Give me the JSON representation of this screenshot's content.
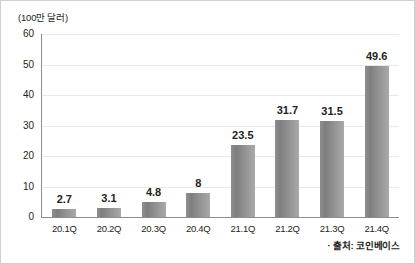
{
  "chart_data": {
    "type": "bar",
    "title": "",
    "unit_caption": "(100만 달러)",
    "xlabel": "",
    "ylabel": "",
    "ylim": [
      0,
      60
    ],
    "yticks": [
      0,
      10,
      20,
      30,
      40,
      50,
      60
    ],
    "ytick_labels": [
      "0",
      "10",
      "20",
      "30",
      "40",
      "50",
      "60"
    ],
    "grid": true,
    "legend": "none",
    "categories": [
      "20.1Q",
      "20.2Q",
      "20.3Q",
      "20.4Q",
      "21.1Q",
      "21.2Q",
      "21.3Q",
      "21.4Q"
    ],
    "values": [
      2.7,
      3.1,
      4.8,
      8,
      23.5,
      31.7,
      31.5,
      49.6
    ],
    "value_labels": [
      "2.7",
      "3.1",
      "4.8",
      "8",
      "23.5",
      "31.7",
      "31.5",
      "49.6"
    ],
    "source_note": "· 출처: 코인베이스",
    "colors": {
      "bar": "#8d8d8d",
      "grid": "#e9e9e9",
      "axis": "#8d8d8d",
      "text": "#231f20",
      "frame": "#cfcfcf",
      "background": "#ffffff"
    }
  }
}
